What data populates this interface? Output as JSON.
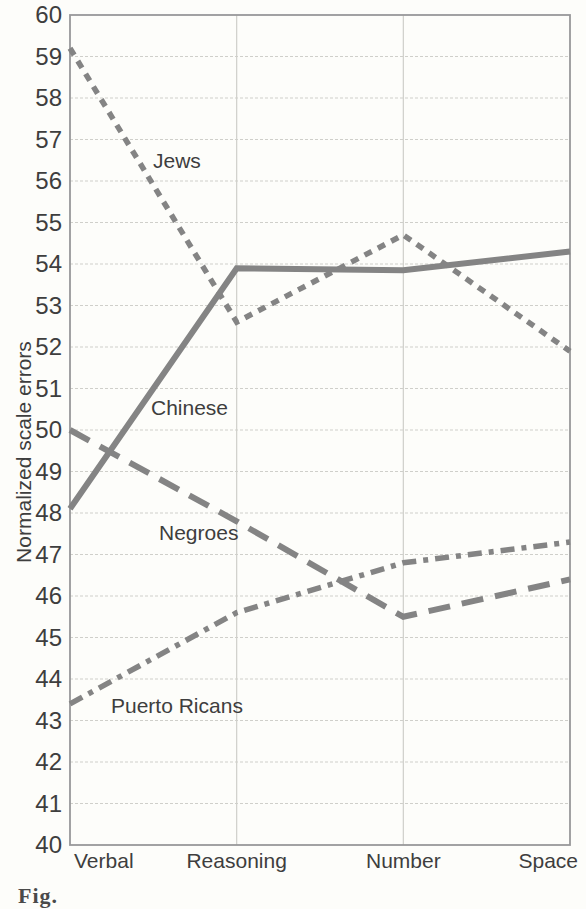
{
  "figure": {
    "ylabel": "Normalized scale errors",
    "caption_partial": "Fig.",
    "background": "#fdfdfa"
  },
  "chart_data": {
    "type": "line",
    "title": "",
    "xlabel": "",
    "ylabel": "Normalized scale errors",
    "ylim": [
      40,
      60
    ],
    "ytick_step": 1,
    "yticks": [
      60,
      59,
      58,
      57,
      56,
      55,
      54,
      53,
      52,
      51,
      50,
      49,
      48,
      47,
      46,
      45,
      44,
      43,
      42,
      41,
      40
    ],
    "grid": true,
    "legend_position": "inline-labels",
    "categories": [
      "Verbal",
      "Reasoning",
      "Number",
      "Space"
    ],
    "series": [
      {
        "name": "Jews",
        "line_style": "dotted",
        "values": [
          59.2,
          52.6,
          54.7,
          51.9
        ]
      },
      {
        "name": "Chinese",
        "line_style": "solid",
        "values": [
          48.1,
          53.9,
          53.85,
          54.3
        ]
      },
      {
        "name": "Negroes",
        "line_style": "long-dash",
        "values": [
          50.0,
          47.8,
          45.5,
          46.4
        ]
      },
      {
        "name": "Puerto Ricans",
        "line_style": "dash-dot",
        "values": [
          43.4,
          45.6,
          46.8,
          47.3
        ]
      }
    ],
    "colors": {
      "line": "#848484",
      "text": "#3e3e3e",
      "grid": "#cfcfca",
      "border": "#98989a"
    }
  }
}
